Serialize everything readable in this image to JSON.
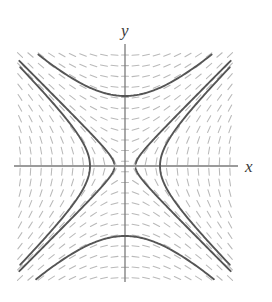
{
  "figure": {
    "title": "",
    "axis_labels": {
      "x": "x",
      "y": "y"
    }
  },
  "chart_data": {
    "type": "line",
    "title": "",
    "subtitle": "",
    "xlabel": "x",
    "ylabel": "y",
    "grid": false,
    "legend": null,
    "xlim": [
      -3,
      3
    ],
    "ylim": [
      -3.2,
      3.2
    ],
    "origin_px": [
      125,
      166
    ],
    "field_box_px": {
      "left": 20,
      "top": 55,
      "right": 230,
      "bottom": 278
    },
    "px_per_unit": 35,
    "slope_field": {
      "equation": "dy/dx = x/y",
      "grid_cols": 21,
      "grid_rows": 22,
      "dash_color": "#b9b9b9",
      "dash_length_px": 7
    },
    "axes": {
      "x_axis_px": {
        "x1": 14,
        "y1": 166,
        "x2": 238,
        "y2": 166
      },
      "y_axis_px": {
        "x1": 125,
        "y1": 44,
        "x2": 125,
        "y2": 282
      },
      "color": "#7a7a7a"
    },
    "curves": [
      {
        "name": "branch-right",
        "equation": "x^2 - y^2 = 1",
        "orientation": "horizontal",
        "vertex_units": [
          1,
          0
        ]
      },
      {
        "name": "branch-left",
        "equation": "x^2 - y^2 = 1",
        "orientation": "horizontal",
        "vertex_units": [
          -1,
          0
        ]
      },
      {
        "name": "branch-top",
        "equation": "y^2 - x^2 = 4",
        "orientation": "vertical",
        "vertex_units": [
          0,
          2
        ]
      },
      {
        "name": "branch-bottom",
        "equation": "y^2 - x^2 = 4",
        "orientation": "vertical",
        "vertex_units": [
          0,
          -2
        ]
      },
      {
        "name": "branch-upper-left-corner",
        "equation": "x^2 - y^2 = 0 (asymptote region)",
        "orientation": "diagonal",
        "vertex_units": [
          -3,
          3
        ]
      },
      {
        "name": "branch-upper-right-corner",
        "equation": "x^2 - y^2 = 0 (asymptote region)",
        "orientation": "diagonal",
        "vertex_units": [
          3,
          3
        ]
      },
      {
        "name": "branch-lower-left-corner",
        "equation": "x^2 - y^2 = 0 (asymptote region)",
        "orientation": "diagonal",
        "vertex_units": [
          -3,
          -3
        ]
      },
      {
        "name": "branch-lower-right-corner",
        "equation": "x^2 - y^2 = 0 (asymptote region)",
        "orientation": "diagonal",
        "vertex_units": [
          3,
          -3
        ]
      }
    ],
    "colors": {
      "curve": "#555555",
      "axis": "#7a7a7a",
      "slope_dash": "#b9b9b9",
      "background": "#ffffff",
      "label": "#3a3a3a"
    }
  }
}
